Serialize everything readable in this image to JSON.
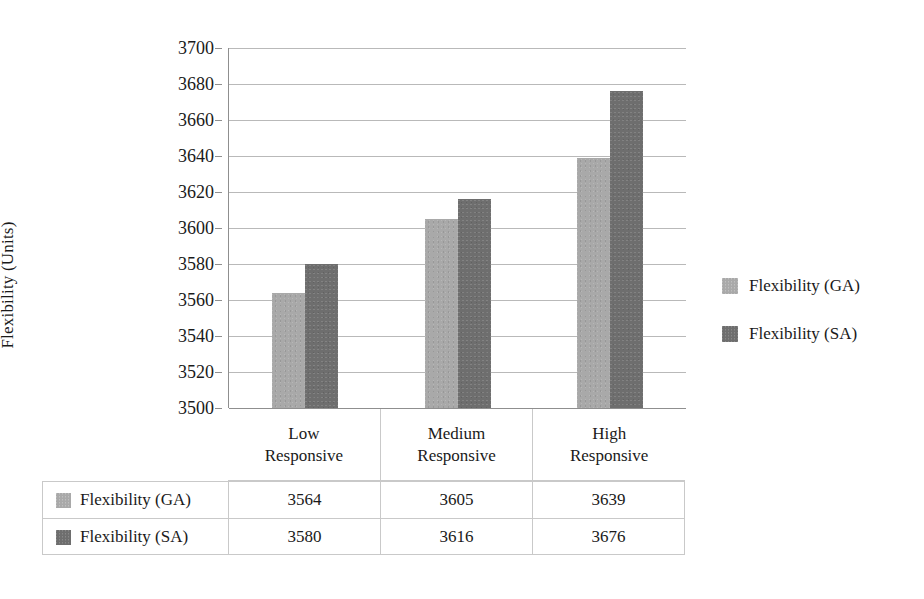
{
  "chart_data": {
    "type": "bar",
    "title": "",
    "xlabel": "",
    "ylabel": "Flexibility (Units)",
    "ylim": [
      3500,
      3700
    ],
    "ytick_step": 20,
    "yticks": [
      3700,
      3680,
      3660,
      3640,
      3620,
      3600,
      3580,
      3560,
      3540,
      3520,
      3500
    ],
    "grid": true,
    "legend_position": "right",
    "categories": [
      "Low Responsive",
      "Medium Responsive",
      "High Responsive"
    ],
    "category_lines": [
      [
        "Low",
        "Responsive"
      ],
      [
        "Medium",
        "Responsive"
      ],
      [
        "High",
        "Responsive"
      ]
    ],
    "series": [
      {
        "name": "Flexibility (GA)",
        "values": [
          3564,
          3605,
          3639
        ],
        "color": "#a9a9a9"
      },
      {
        "name": "Flexibility (SA)",
        "values": [
          3580,
          3616,
          3676
        ],
        "color": "#6e6e6e"
      }
    ]
  },
  "legend": {
    "items": [
      {
        "label": "Flexibility (GA)",
        "swatch": "legend-swatch-ga"
      },
      {
        "label": "Flexibility (SA)",
        "swatch": "legend-swatch-sa"
      }
    ]
  },
  "data_table": {
    "rows": [
      {
        "series": "Flexibility (GA)",
        "cells": [
          "3564",
          "3605",
          "3639"
        ]
      },
      {
        "series": "Flexibility (SA)",
        "cells": [
          "3580",
          "3616",
          "3676"
        ]
      }
    ]
  },
  "colors": {
    "series_ga": "#a9a9a9",
    "series_sa": "#6e6e6e",
    "gridline": "#b9b9b9",
    "axis": "#8f8f8f",
    "table_border": "#c9c9c9",
    "text": "#1a1a1a",
    "background": "#ffffff"
  }
}
